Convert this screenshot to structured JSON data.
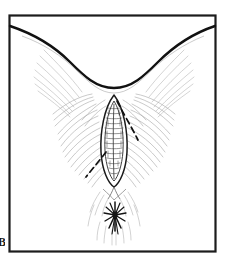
{
  "figure": {
    "label": "B",
    "caption_fragment": "",
    "type": "anatomical line drawing",
    "background_color": "#ffffff",
    "frame_color": "#1c1c1c",
    "ink_color": "#1a1a1a",
    "hatch_color": "#9a9a9a",
    "dashed_color": "#141414"
  },
  "frame": {
    "x": 9,
    "y": 15,
    "width": 207,
    "height": 237,
    "stroke_width": 2.2
  },
  "elements": {
    "upper_contour_name": "thigh-fold-contour",
    "central_oval_name": "midline-oval",
    "dashed_incision_name": "dashed-incision-line",
    "starburst_name": "radiating-starburst",
    "hatching_left_name": "left-fan-hatching",
    "hatching_right_name": "right-fan-hatching"
  },
  "geometry": {
    "oval_center_x": 114,
    "oval_top_y": 96,
    "oval_bottom_y": 186,
    "oval_half_width": 13,
    "starburst_x": 115,
    "starburst_y": 215,
    "contour_left_x": 11,
    "contour_apex_y": 73,
    "contour_right_x": 214
  }
}
